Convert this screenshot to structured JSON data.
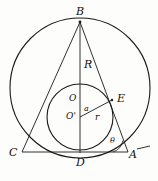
{
  "figure": {
    "type": "geometry-diagram",
    "width": 158,
    "height": 181,
    "stroke_color": "#1a1a1a",
    "background_color": "#fdfdfc",
    "label_color": "#111111"
  },
  "labels": {
    "vertex_b": "B",
    "vertex_c": "C",
    "vertex_a": "A",
    "point_d": "D",
    "point_e": "E",
    "center_o": "O",
    "center_o_prime": "O'",
    "circumradius": "R",
    "inradius": "r",
    "segment_a": "a",
    "angle_theta": "θ"
  },
  "geometry": {
    "circumcircle": {
      "cx": 80,
      "cy": 88,
      "r": 70
    },
    "incircle": {
      "cx": 80,
      "cy": 117,
      "r": 33
    },
    "points": {
      "B": [
        80,
        22
      ],
      "C": [
        22,
        152
      ],
      "A": [
        128,
        152
      ],
      "D": [
        80,
        152
      ],
      "E": [
        112,
        100
      ],
      "O": [
        80,
        88
      ],
      "O_prime": [
        80,
        117
      ]
    },
    "segments": [
      {
        "name": "BC",
        "from": "B",
        "to": "C"
      },
      {
        "name": "BA",
        "from": "B",
        "to": "A"
      },
      {
        "name": "CA",
        "from": "C",
        "to": "A"
      },
      {
        "name": "BD",
        "from": "B",
        "to": "D"
      },
      {
        "name": "O'E",
        "from": "O_prime",
        "to": "E"
      }
    ],
    "angle_arc": {
      "vertex": "A",
      "radius": 15
    },
    "tick_mark": {
      "x1": 138,
      "y1": 148,
      "x2": 150,
      "y2": 146
    }
  }
}
